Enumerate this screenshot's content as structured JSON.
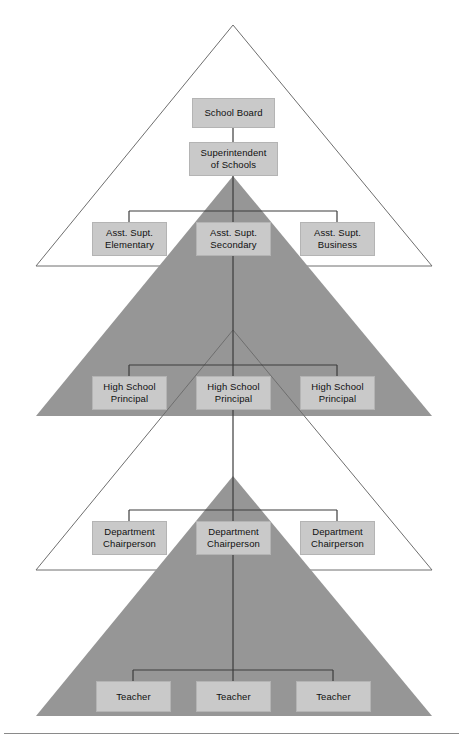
{
  "diagram": {
    "type": "nested-pyramid-org-chart",
    "colors": {
      "page_background": "#ffffff",
      "triangle_fill_shaded": "#969696",
      "triangle_outline": "#6e6e6e",
      "box_fill": "#c9c9c9",
      "box_border": "#b4b4b4",
      "connector_line": "#3c3c3c",
      "rule_line": "#8a8a8a",
      "text": "#101010"
    },
    "triangles": [
      {
        "name": "triangle-level-1-outline",
        "style": "outline",
        "apex_x": 233,
        "apex_y": 25,
        "base_y": 266,
        "left_x": 36,
        "right_x": 432
      },
      {
        "name": "triangle-level-2-shaded",
        "style": "filled",
        "apex_x": 233,
        "apex_y": 176,
        "base_y": 416,
        "left_x": 36,
        "right_x": 432
      },
      {
        "name": "triangle-level-3-outline",
        "style": "outline",
        "apex_x": 233,
        "apex_y": 330,
        "base_y": 570,
        "left_x": 36,
        "right_x": 432
      },
      {
        "name": "triangle-level-4-shaded",
        "style": "filled",
        "apex_x": 233,
        "apex_y": 476,
        "base_y": 716,
        "left_x": 36,
        "right_x": 432
      }
    ],
    "levels": [
      {
        "level": 1,
        "name": "board-level",
        "nodes": [
          {
            "id": "school-board",
            "label": "School Board",
            "x": 192,
            "y": 98,
            "w": 83,
            "h": 30
          }
        ]
      },
      {
        "level": 2,
        "name": "superintendent-level",
        "nodes": [
          {
            "id": "superintendent-of-schools",
            "label": "Superintendent\nof Schools",
            "x": 189,
            "y": 142,
            "w": 89,
            "h": 34
          }
        ]
      },
      {
        "level": 3,
        "name": "assistant-superintendent-level",
        "nodes": [
          {
            "id": "asst-supt-elementary",
            "label": "Asst. Supt.\nElementary",
            "x": 92,
            "y": 222,
            "w": 75,
            "h": 34
          },
          {
            "id": "asst-supt-secondary",
            "label": "Asst. Supt.\nSecondary",
            "x": 196,
            "y": 222,
            "w": 75,
            "h": 34
          },
          {
            "id": "asst-supt-business",
            "label": "Asst. Supt.\nBusiness",
            "x": 300,
            "y": 222,
            "w": 75,
            "h": 34
          }
        ]
      },
      {
        "level": 4,
        "name": "principal-level",
        "nodes": [
          {
            "id": "high-school-principal-1",
            "label": "High School\nPrincipal",
            "x": 92,
            "y": 376,
            "w": 75,
            "h": 34
          },
          {
            "id": "high-school-principal-2",
            "label": "High School\nPrincipal",
            "x": 196,
            "y": 376,
            "w": 75,
            "h": 34
          },
          {
            "id": "high-school-principal-3",
            "label": "High School\nPrincipal",
            "x": 300,
            "y": 376,
            "w": 75,
            "h": 34
          }
        ]
      },
      {
        "level": 5,
        "name": "department-chairperson-level",
        "nodes": [
          {
            "id": "department-chairperson-1",
            "label": "Department\nChairperson",
            "x": 92,
            "y": 521,
            "w": 75,
            "h": 34
          },
          {
            "id": "department-chairperson-2",
            "label": "Department\nChairperson",
            "x": 196,
            "y": 521,
            "w": 75,
            "h": 34
          },
          {
            "id": "department-chairperson-3",
            "label": "Department\nChairperson",
            "x": 300,
            "y": 521,
            "w": 75,
            "h": 34
          }
        ]
      },
      {
        "level": 6,
        "name": "teacher-level",
        "nodes": [
          {
            "id": "teacher-1",
            "label": "Teacher",
            "x": 96,
            "y": 681,
            "w": 75,
            "h": 31
          },
          {
            "id": "teacher-2",
            "label": "Teacher",
            "x": 196,
            "y": 681,
            "w": 75,
            "h": 31
          },
          {
            "id": "teacher-3",
            "label": "Teacher",
            "x": 296,
            "y": 681,
            "w": 75,
            "h": 31
          }
        ]
      }
    ],
    "connectors": {
      "spine_x": 233,
      "branch_rows": [
        {
          "name": "asst-supt-branch",
          "bar_y": 211,
          "left_x": 129,
          "right_x": 337,
          "drop_to_y": 222
        },
        {
          "name": "principal-branch",
          "bar_y": 365,
          "left_x": 129,
          "right_x": 337,
          "drop_to_y": 376
        },
        {
          "name": "chairperson-branch",
          "bar_y": 510,
          "left_x": 129,
          "right_x": 337,
          "drop_to_y": 521
        },
        {
          "name": "teacher-branch",
          "bar_y": 670,
          "left_x": 133,
          "right_x": 333,
          "drop_to_y": 681
        }
      ]
    },
    "bottom_rule": {
      "name": "footer-rule",
      "y": 733
    }
  }
}
